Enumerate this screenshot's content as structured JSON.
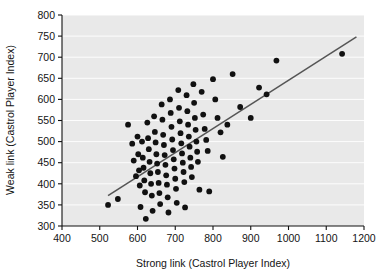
{
  "chart_data": {
    "type": "scatter",
    "title": "",
    "xlabel": "Strong link (Castrol Player Index)",
    "ylabel": "Weak link (Castrol Player Index)",
    "xlim": [
      400,
      1200
    ],
    "ylim": [
      300,
      800
    ],
    "xticks": [
      400,
      500,
      600,
      700,
      800,
      900,
      1000,
      1100,
      1200
    ],
    "yticks": [
      300,
      350,
      400,
      450,
      500,
      550,
      600,
      650,
      700,
      750,
      800
    ],
    "grid": "horizontal",
    "legend": "none",
    "plot_background": "#e9e9e9",
    "point_color": "#111111",
    "trendline_color": "#555555",
    "trendline": {
      "x": [
        522,
        1180
      ],
      "y": [
        372,
        748
      ]
    },
    "series": [
      {
        "name": "Teams",
        "marker": "filled-circle",
        "points": [
          [
            522,
            350
          ],
          [
            548,
            364
          ],
          [
            575,
            540
          ],
          [
            586,
            495
          ],
          [
            590,
            455
          ],
          [
            596,
            418
          ],
          [
            600,
            512
          ],
          [
            602,
            470
          ],
          [
            604,
            432
          ],
          [
            606,
            396
          ],
          [
            608,
            345
          ],
          [
            612,
            500
          ],
          [
            614,
            462
          ],
          [
            616,
            438
          ],
          [
            618,
            408
          ],
          [
            620,
            380
          ],
          [
            622,
            317
          ],
          [
            626,
            545
          ],
          [
            628,
            508
          ],
          [
            630,
            482
          ],
          [
            632,
            452
          ],
          [
            634,
            425
          ],
          [
            636,
            400
          ],
          [
            638,
            372
          ],
          [
            640,
            336
          ],
          [
            644,
            560
          ],
          [
            646,
            523
          ],
          [
            648,
            498
          ],
          [
            650,
            470
          ],
          [
            652,
            448
          ],
          [
            654,
            428
          ],
          [
            656,
            402
          ],
          [
            658,
            378
          ],
          [
            660,
            352
          ],
          [
            664,
            588
          ],
          [
            666,
            552
          ],
          [
            668,
            516
          ],
          [
            670,
            492
          ],
          [
            672,
            468
          ],
          [
            674,
            445
          ],
          [
            676,
            420
          ],
          [
            678,
            398
          ],
          [
            680,
            368
          ],
          [
            682,
            332
          ],
          [
            686,
            600
          ],
          [
            688,
            568
          ],
          [
            690,
            535
          ],
          [
            692,
            505
          ],
          [
            694,
            480
          ],
          [
            696,
            458
          ],
          [
            698,
            436
          ],
          [
            700,
            412
          ],
          [
            702,
            388
          ],
          [
            704,
            355
          ],
          [
            708,
            622
          ],
          [
            710,
            580
          ],
          [
            712,
            548
          ],
          [
            714,
            520
          ],
          [
            716,
            496
          ],
          [
            718,
            472
          ],
          [
            720,
            450
          ],
          [
            722,
            428
          ],
          [
            724,
            404
          ],
          [
            726,
            344
          ],
          [
            730,
            610
          ],
          [
            732,
            572
          ],
          [
            734,
            540
          ],
          [
            736,
            512
          ],
          [
            738,
            488
          ],
          [
            740,
            462
          ],
          [
            742,
            440
          ],
          [
            744,
            416
          ],
          [
            748,
            636
          ],
          [
            750,
            592
          ],
          [
            752,
            556
          ],
          [
            754,
            528
          ],
          [
            756,
            500
          ],
          [
            758,
            476
          ],
          [
            760,
            452
          ],
          [
            764,
            386
          ],
          [
            770,
            618
          ],
          [
            774,
            564
          ],
          [
            778,
            530
          ],
          [
            782,
            504
          ],
          [
            786,
            478
          ],
          [
            790,
            382
          ],
          [
            800,
            648
          ],
          [
            806,
            600
          ],
          [
            812,
            556
          ],
          [
            820,
            522
          ],
          [
            826,
            464
          ],
          [
            838,
            540
          ],
          [
            852,
            660
          ],
          [
            872,
            582
          ],
          [
            900,
            556
          ],
          [
            922,
            628
          ],
          [
            942,
            612
          ],
          [
            968,
            692
          ],
          [
            1142,
            708
          ]
        ]
      }
    ]
  },
  "axes_geometry": {
    "plot_left": 62,
    "plot_right": 364,
    "plot_top": 15,
    "plot_bottom": 226
  }
}
